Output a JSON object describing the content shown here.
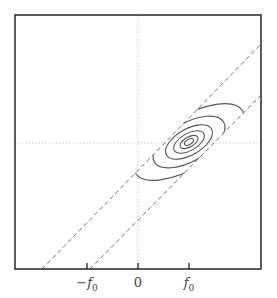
{
  "figure": {
    "width": 277,
    "height": 298,
    "frame": {
      "x": 15,
      "y": 15,
      "width": 246,
      "height": 254
    },
    "colors": {
      "frame": "#333333",
      "guides": "#bbbbbb",
      "dashed_lines": "#666666",
      "contours": "#555555",
      "labels": "#444444"
    },
    "origin_px": {
      "x": 138,
      "y": 143
    },
    "guides": {
      "vertical_x": 138,
      "horizontal_y": 143
    },
    "dashed_lines": [
      {
        "name": "upper-band-edge",
        "x1": 42,
        "y1": 269,
        "x2": 261,
        "y2": 44
      },
      {
        "name": "lower-band-edge",
        "x1": 90,
        "y1": 269,
        "x2": 261,
        "y2": 95
      }
    ],
    "contours": {
      "center": {
        "x": 189,
        "y": 142
      },
      "rotation_deg": -30,
      "ellipses": [
        {
          "rx": 5,
          "ry": 2.5
        },
        {
          "rx": 10,
          "ry": 5
        },
        {
          "rx": 17,
          "ry": 8.5
        },
        {
          "rx": 26,
          "ry": 13
        },
        {
          "rx": 40,
          "ry": 19
        },
        {
          "rx": 62,
          "ry": 26
        }
      ]
    },
    "x_axis": {
      "ticks": [
        {
          "x": 87,
          "label_main": "−f",
          "label_sub": "0"
        },
        {
          "x": 138,
          "label_main": "0",
          "label_sub": ""
        },
        {
          "x": 189,
          "label_main": "f",
          "label_sub": "0"
        }
      ]
    }
  }
}
